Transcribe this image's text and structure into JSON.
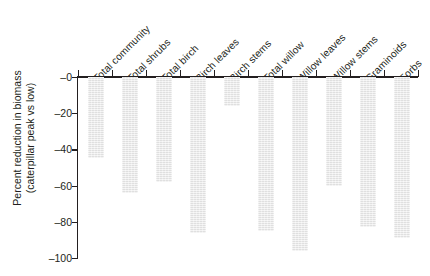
{
  "chart_data": {
    "type": "bar",
    "title": "",
    "subtitle": "",
    "xlabel": "",
    "ylabel": "Percent reduction in biomass (caterpillar peak vs low)",
    "ylabel_line1": "Percent reduction in biomass",
    "ylabel_line2": "(caterpillar peak vs low)",
    "categories": [
      "Total community",
      "Total shrubs",
      "Total birch",
      "Birch leaves",
      "Birch stems",
      "Total willow",
      "Willow leaves",
      "Willow stems",
      "Graminoids",
      "Forbs"
    ],
    "values": [
      -45,
      -64,
      -58,
      -86,
      -16,
      -85,
      -96,
      -60,
      -83,
      -89
    ],
    "ylim": [
      -100,
      0
    ],
    "yticks": [
      0,
      -20,
      -40,
      -60,
      -80,
      -100
    ],
    "ytick_labels": [
      "–0",
      "–20",
      "–40",
      "–60",
      "–80",
      "–100"
    ],
    "grid": false,
    "legend": false,
    "legend_position": "none",
    "bar_color": "#e9e9e9",
    "axis_color": "#231f20",
    "text_color": "#231f20",
    "category_label_rotation_deg": 45,
    "bars_direction": "downward-from-zero"
  }
}
